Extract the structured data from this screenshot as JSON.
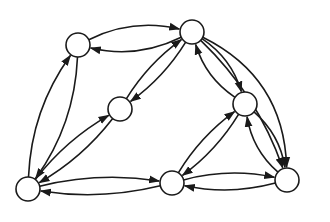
{
  "diagram": {
    "type": "directed-graph",
    "stroke_color": "#1a1a1a",
    "fill_color": "#ffffff",
    "node_radius": 12,
    "nodes": [
      {
        "id": "A",
        "x": 78,
        "y": 45
      },
      {
        "id": "B",
        "x": 192,
        "y": 32
      },
      {
        "id": "C",
        "x": 120,
        "y": 109
      },
      {
        "id": "D",
        "x": 245,
        "y": 104
      },
      {
        "id": "E",
        "x": 28,
        "y": 189
      },
      {
        "id": "F",
        "x": 172,
        "y": 183
      },
      {
        "id": "G",
        "x": 287,
        "y": 180
      }
    ],
    "edges": [
      {
        "from": "A",
        "to": "B",
        "bend": -0.18
      },
      {
        "from": "B",
        "to": "A",
        "bend": -0.18
      },
      {
        "from": "E",
        "to": "A",
        "bend": -0.15
      },
      {
        "from": "A",
        "to": "E",
        "bend": -0.15
      },
      {
        "from": "C",
        "to": "B",
        "bend": -0.1
      },
      {
        "from": "B",
        "to": "C",
        "bend": -0.1
      },
      {
        "from": "E",
        "to": "C",
        "bend": -0.1
      },
      {
        "from": "C",
        "to": "E",
        "bend": -0.1
      },
      {
        "from": "B",
        "to": "D",
        "bend": -0.18
      },
      {
        "from": "D",
        "to": "B",
        "bend": -0.18
      },
      {
        "from": "B",
        "to": "G",
        "bend": -0.3
      },
      {
        "from": "B",
        "to": "G",
        "bend": -0.12
      },
      {
        "from": "D",
        "to": "G",
        "bend": -0.18
      },
      {
        "from": "G",
        "to": "D",
        "bend": -0.18
      },
      {
        "from": "F",
        "to": "D",
        "bend": -0.1
      },
      {
        "from": "D",
        "to": "F",
        "bend": -0.1
      },
      {
        "from": "E",
        "to": "F",
        "bend": -0.1
      },
      {
        "from": "F",
        "to": "E",
        "bend": -0.1
      },
      {
        "from": "F",
        "to": "G",
        "bend": -0.12
      },
      {
        "from": "G",
        "to": "F",
        "bend": -0.12
      }
    ]
  }
}
